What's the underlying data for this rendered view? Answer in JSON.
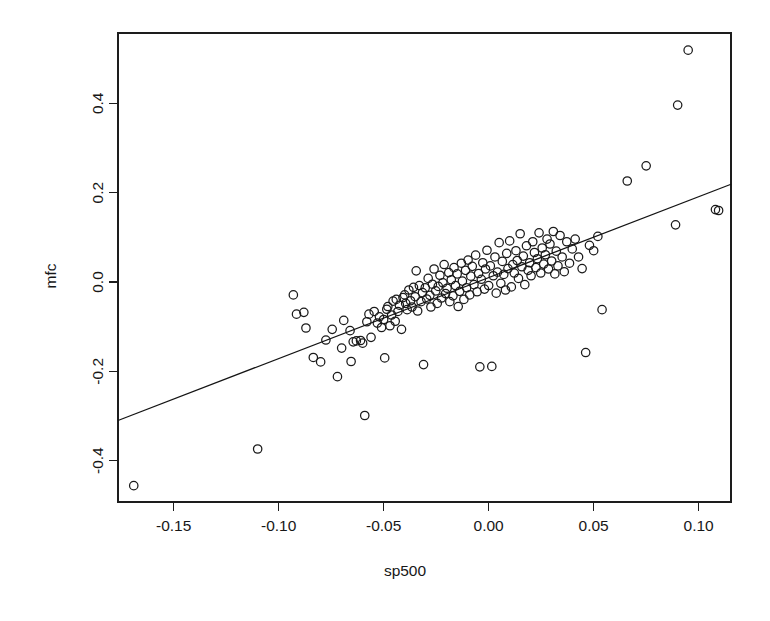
{
  "chart_data": {
    "type": "scatter",
    "title": "",
    "xlabel": "sp500",
    "ylabel": "mfc",
    "xlim": [
      -0.1765,
      0.1154
    ],
    "ylim": [
      -0.4926,
      0.5574
    ],
    "grid": false,
    "legend": "none",
    "xticks": [
      -0.15,
      -0.1,
      -0.05,
      0.0,
      0.05,
      0.1
    ],
    "xtick_labels": [
      "-0.15",
      "-0.10",
      "-0.05",
      "0.00",
      "0.05",
      "0.10"
    ],
    "yticks": [
      -0.4,
      -0.2,
      0.0,
      0.2,
      0.4
    ],
    "ytick_labels": [
      "-0.4",
      "-0.2",
      "0.0",
      "0.2",
      "0.4"
    ],
    "point_marker": "open-circle",
    "point_radius_px": 4.2,
    "point_color": "#1a1a1a",
    "fit_line": {
      "type": "linear-regression",
      "slope": 1.812,
      "intercept": 0.0097,
      "x_start": -0.1765,
      "x_end": 0.1154,
      "color": "#141414"
    },
    "n_points": 161,
    "x": [
      -0.169,
      -0.11,
      -0.093,
      -0.0915,
      -0.088,
      -0.087,
      -0.0835,
      -0.08,
      -0.0775,
      -0.0745,
      -0.072,
      -0.07,
      -0.069,
      -0.066,
      -0.0655,
      -0.0645,
      -0.063,
      -0.061,
      -0.06,
      -0.059,
      -0.058,
      -0.057,
      -0.056,
      -0.0545,
      -0.053,
      -0.052,
      -0.051,
      -0.05,
      -0.0495,
      -0.0485,
      -0.048,
      -0.047,
      -0.0462,
      -0.0455,
      -0.0445,
      -0.044,
      -0.0432,
      -0.0425,
      -0.0415,
      -0.0408,
      -0.04,
      -0.0395,
      -0.0388,
      -0.038,
      -0.0372,
      -0.0365,
      -0.0358,
      -0.035,
      -0.0345,
      -0.0338,
      -0.033,
      -0.0322,
      -0.0315,
      -0.031,
      -0.0302,
      -0.0295,
      -0.0288,
      -0.028,
      -0.0275,
      -0.0268,
      -0.026,
      -0.0252,
      -0.0245,
      -0.024,
      -0.0232,
      -0.0225,
      -0.0218,
      -0.0212,
      -0.0205,
      -0.0198,
      -0.019,
      -0.0185,
      -0.0178,
      -0.017,
      -0.0165,
      -0.0158,
      -0.015,
      -0.0145,
      -0.0138,
      -0.013,
      -0.0125,
      -0.0118,
      -0.011,
      -0.0105,
      -0.0098,
      -0.009,
      -0.0085,
      -0.0078,
      -0.007,
      -0.0062,
      -0.0055,
      -0.0048,
      -0.0042,
      -0.0035,
      -0.0028,
      -0.002,
      -0.0015,
      -0.0008,
      0.0,
      0.0008,
      0.0015,
      0.0022,
      0.003,
      0.0036,
      0.0042,
      0.005,
      0.0058,
      0.0065,
      0.0072,
      0.008,
      0.0086,
      0.0092,
      0.01,
      0.0108,
      0.0115,
      0.0122,
      0.013,
      0.0136,
      0.0142,
      0.015,
      0.0158,
      0.0165,
      0.0172,
      0.018,
      0.0188,
      0.0195,
      0.0202,
      0.021,
      0.0218,
      0.0225,
      0.0232,
      0.024,
      0.0248,
      0.0255,
      0.0262,
      0.027,
      0.0278,
      0.0285,
      0.0292,
      0.03,
      0.0308,
      0.0315,
      0.0322,
      0.033,
      0.034,
      0.035,
      0.036,
      0.0372,
      0.0385,
      0.0398,
      0.0412,
      0.0428,
      0.0445,
      0.0462,
      0.048,
      0.05,
      0.052,
      0.054,
      0.066,
      0.075,
      0.089,
      0.09,
      0.095,
      0.108,
      0.1095
    ],
    "y": [
      -0.456,
      -0.374,
      -0.029,
      -0.072,
      -0.068,
      -0.103,
      -0.169,
      -0.179,
      -0.13,
      -0.106,
      -0.212,
      -0.148,
      -0.086,
      -0.109,
      -0.178,
      -0.134,
      -0.132,
      -0.131,
      -0.137,
      -0.299,
      -0.089,
      -0.072,
      -0.124,
      -0.066,
      -0.092,
      -0.078,
      -0.102,
      -0.084,
      -0.17,
      -0.061,
      -0.055,
      -0.098,
      -0.074,
      -0.043,
      -0.088,
      -0.039,
      -0.066,
      -0.052,
      -0.106,
      -0.035,
      -0.029,
      -0.048,
      -0.062,
      -0.018,
      -0.042,
      -0.056,
      -0.012,
      -0.033,
      0.025,
      -0.065,
      -0.008,
      -0.044,
      -0.024,
      -0.185,
      -0.013,
      -0.038,
      0.008,
      -0.03,
      -0.056,
      -0.005,
      0.029,
      -0.02,
      -0.048,
      -0.01,
      0.015,
      -0.036,
      -0.002,
      0.039,
      -0.026,
      -0.014,
      0.021,
      -0.044,
      0.005,
      -0.031,
      0.032,
      -0.008,
      0.018,
      -0.055,
      -0.021,
      0.042,
      0.002,
      -0.039,
      0.026,
      -0.013,
      0.049,
      -0.029,
      0.013,
      0.035,
      -0.006,
      0.06,
      -0.022,
      0.019,
      -0.19,
      0.006,
      0.043,
      -0.016,
      0.029,
      0.071,
      -0.008,
      0.036,
      -0.189,
      0.014,
      0.056,
      -0.025,
      0.022,
      0.088,
      -0.003,
      0.046,
      0.017,
      -0.018,
      0.064,
      0.03,
      0.092,
      -0.011,
      0.039,
      0.02,
      0.07,
      0.048,
      0.008,
      0.108,
      0.034,
      0.058,
      -0.006,
      0.081,
      0.026,
      0.043,
      0.014,
      0.09,
      0.066,
      0.032,
      0.052,
      0.11,
      0.02,
      0.076,
      0.04,
      0.061,
      0.096,
      0.029,
      0.085,
      0.047,
      0.113,
      0.018,
      0.069,
      0.036,
      0.104,
      0.056,
      0.023,
      0.09,
      0.042,
      0.074,
      0.096,
      0.056,
      0.03,
      -0.158,
      0.082,
      0.07,
      0.102,
      -0.062,
      0.226,
      0.26,
      0.128,
      0.396,
      0.519,
      0.162,
      0.16
    ]
  },
  "axes": {
    "x_title": "sp500",
    "y_title": "mfc"
  }
}
